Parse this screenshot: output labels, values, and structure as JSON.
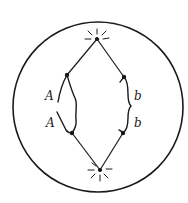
{
  "diagram": {
    "colors": {
      "ink": "#1a1a1a",
      "background": "#ffffff"
    },
    "cell": {
      "cx": 98,
      "cy": 107,
      "r": 85
    },
    "poles": [
      {
        "id": "top-pole",
        "x": 97,
        "y": 39
      },
      {
        "id": "bottom-pole",
        "x": 100,
        "y": 170
      }
    ],
    "labels": {
      "left_upper": "A",
      "left_lower": "A",
      "right_upper": "b",
      "right_lower": "b"
    }
  }
}
